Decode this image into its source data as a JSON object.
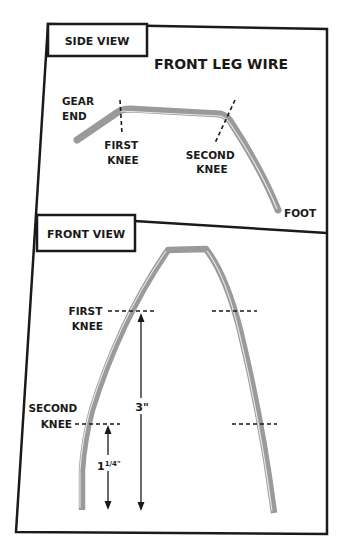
{
  "diagram": {
    "title": "FRONT LEG WIRE",
    "side_view": {
      "tab_label": "SIDE VIEW",
      "labels": {
        "gear_end_1": "GEAR",
        "gear_end_2": "END",
        "first_knee_1": "FIRST",
        "first_knee_2": "KNEE",
        "second_knee_1": "SECOND",
        "second_knee_2": "KNEE",
        "foot": "FOOT"
      }
    },
    "front_view": {
      "tab_label": "FRONT VIEW",
      "labels": {
        "first_knee_1": "FIRST",
        "first_knee_2": "KNEE",
        "second_knee_1": "SECOND",
        "second_knee_2": "KNEE"
      },
      "dimensions": {
        "total_height": "3\"",
        "lower_height_whole": "1",
        "lower_height_frac": "1/4\""
      }
    },
    "colors": {
      "frame": "#1a1a1a",
      "wire": "#9a9a9a",
      "wire_highlight": "#e8e8e8"
    }
  }
}
